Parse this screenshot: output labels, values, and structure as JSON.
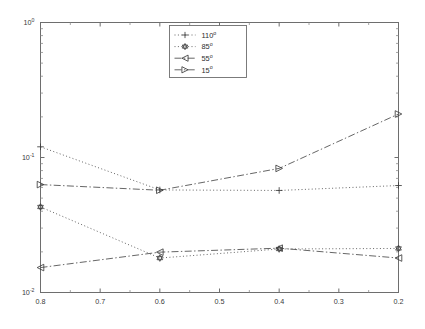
{
  "chart_data": {
    "type": "line",
    "title": "",
    "xlabel": "",
    "ylabel": "",
    "x": [
      0.8,
      0.6,
      0.4,
      0.2
    ],
    "xticklabels": [
      "0.8",
      "0.7",
      "0.6",
      "0.5",
      "0.4",
      "0.3",
      "0.2"
    ],
    "xtickvalues": [
      0.8,
      0.7,
      0.6,
      0.5,
      0.4,
      0.3,
      0.2
    ],
    "xlim": [
      0.8,
      0.2
    ],
    "x_axis_scale": "linear",
    "x_axis_direction": "reversed",
    "yticklabels": [
      "10^0",
      "10^-1",
      "10^-2"
    ],
    "ytickvalues": [
      1,
      0.1,
      0.01
    ],
    "ylim": [
      0.01,
      1
    ],
    "y_axis_scale": "log",
    "grid": false,
    "legend_position": "top-center",
    "series": [
      {
        "name": "110°",
        "label_base": "110",
        "label_sup": "o",
        "marker": "plus",
        "linestyle": "dotted",
        "values": [
          0.12,
          0.0575,
          0.057,
          0.062
        ]
      },
      {
        "name": "85°",
        "label_base": "85",
        "label_sup": "o",
        "marker": "hexagram",
        "linestyle": "dotted",
        "values": [
          0.043,
          0.018,
          0.021,
          0.0212
        ]
      },
      {
        "name": "55°",
        "label_base": "55",
        "label_sup": "o",
        "marker": "triangle-left",
        "linestyle": "dashdot",
        "values": [
          0.0153,
          0.0199,
          0.0213,
          0.018
        ]
      },
      {
        "name": "15°",
        "label_base": "15",
        "label_sup": "o",
        "marker": "triangle-right",
        "linestyle": "dashdot",
        "values": [
          0.063,
          0.0572,
          0.083,
          0.21
        ]
      }
    ]
  },
  "axes": {
    "frame_color": "#6e6e6e",
    "line_color": "#4a4a4a",
    "text_color": "#3a3a3a",
    "background": "#ffffff"
  },
  "legend": {
    "entries": [
      "110°",
      "85°",
      "55°",
      "15°"
    ]
  }
}
